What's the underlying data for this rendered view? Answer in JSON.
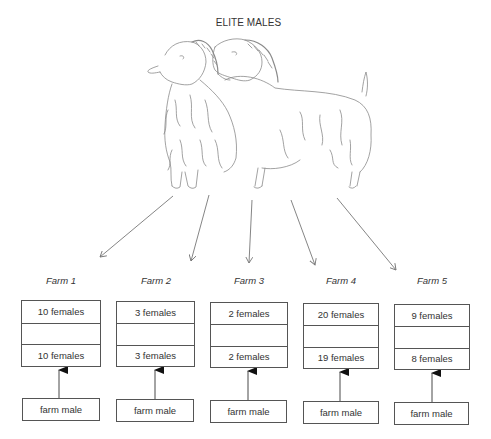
{
  "title": "ELITE MALES",
  "illustration": {
    "subject": "two Angora goat bucks (elite males)",
    "icon": "goat-illustration"
  },
  "farms": [
    {
      "label": "Farm 1",
      "top_females": "10 females",
      "bottom_females": "10 females",
      "male": "farm male"
    },
    {
      "label": "Farm 2",
      "top_females": "3 females",
      "bottom_females": "3 females",
      "male": "farm male"
    },
    {
      "label": "Farm 3",
      "top_females": "2 females",
      "bottom_females": "2 females",
      "male": "farm male"
    },
    {
      "label": "Farm 4",
      "top_females": "20 females",
      "bottom_females": "19 females",
      "male": "farm male"
    },
    {
      "label": "Farm 5",
      "top_females": "9 females",
      "bottom_females": "8 females",
      "male": "farm male"
    }
  ],
  "colors": {
    "line": "#555555",
    "text": "#333333",
    "background": "#ffffff"
  }
}
